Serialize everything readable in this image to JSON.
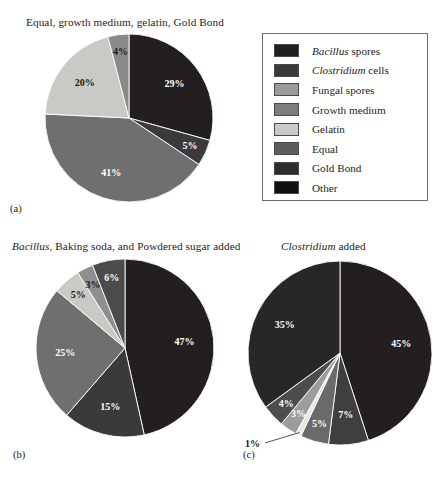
{
  "figure": {
    "caption_labels": {
      "a": "(a)",
      "b": "(b)",
      "c": "(c)"
    }
  },
  "legend": {
    "title": "",
    "items": [
      {
        "label": "Bacillus spores",
        "italic_prefix": "Bacillus",
        "rest": " spores",
        "color": "#231f20"
      },
      {
        "label": "Clostridium cells",
        "italic_prefix": "Clostridium",
        "rest": " cells",
        "color": "#3a3a3a"
      },
      {
        "label": "Fungal spores",
        "italic_prefix": "",
        "rest": "Fungal spores",
        "color": "#9a9a9a"
      },
      {
        "label": "Growth medium",
        "italic_prefix": "",
        "rest": "Growth medium",
        "color": "#7d7d7d"
      },
      {
        "label": "Gelatin",
        "italic_prefix": "",
        "rest": "Gelatin",
        "color": "#c9c9c5"
      },
      {
        "label": "Equal",
        "italic_prefix": "",
        "rest": "Equal",
        "color": "#5d5d5d"
      },
      {
        "label": "Gold Bond",
        "italic_prefix": "",
        "rest": "Gold Bond",
        "color": "#2e2e2e"
      },
      {
        "label": "Other",
        "italic_prefix": "",
        "rest": "Other",
        "color": "#111111"
      }
    ]
  },
  "chart_data": [
    {
      "type": "pie",
      "panel": "(a)",
      "title": "Equal, growth medium, gelatin, Gold Bond",
      "title_italic_prefix": "",
      "legend_position": "right",
      "categories": [
        "Bacillus spores",
        "Clostridium cells",
        "Growth medium",
        "Gelatin",
        "Fungal spores"
      ],
      "values": [
        29,
        5,
        41,
        20,
        4
      ],
      "labels": [
        "29%",
        "5%",
        "41%",
        "20%",
        "4%"
      ],
      "colors": [
        "#231f20",
        "#3a3a3a",
        "#6f6f6f",
        "#c9c9c5",
        "#8a8a8a"
      ],
      "label_colors": [
        "#ffffff",
        "#ffffff",
        "#ffffff",
        "#1a1a1a",
        "#1a1a1a"
      ],
      "start_angle_deg": 0
    },
    {
      "type": "pie",
      "panel": "(b)",
      "title": "Bacillus, Baking soda, and Powdered sugar added",
      "title_italic_prefix": "Bacillus",
      "title_rest": ", Baking soda, and Powdered sugar added",
      "legend_position": "shared",
      "categories": [
        "Bacillus spores",
        "Clostridium cells",
        "Growth medium",
        "Gelatin",
        "Fungal spores",
        "Equal"
      ],
      "values": [
        47,
        15,
        25,
        5,
        3,
        6
      ],
      "labels": [
        "47%",
        "15%",
        "25%",
        "5%",
        "3%",
        "6%"
      ],
      "colors": [
        "#231f20",
        "#3a3a3a",
        "#6f6f6f",
        "#c9c9c5",
        "#8f8f8f",
        "#4b4b4b"
      ],
      "label_colors": [
        "#ffffff",
        "#ffffff",
        "#ffffff",
        "#1a1a1a",
        "#1a1a1a",
        "#ffffff"
      ],
      "start_angle_deg": 0
    },
    {
      "type": "pie",
      "panel": "(c)",
      "title": "Clostridium added",
      "title_italic_prefix": "Clostridium",
      "title_rest": " added",
      "legend_position": "shared",
      "categories": [
        "Bacillus spores",
        "Clostridium cells",
        "Growth medium",
        "Gelatin",
        "Fungal spores",
        "Equal",
        "Other"
      ],
      "values": [
        45,
        7,
        5,
        1,
        3,
        4,
        35
      ],
      "labels": [
        "45%",
        "7%",
        "5%",
        "1%",
        "3%",
        "4%",
        "35%"
      ],
      "colors": [
        "#231f20",
        "#3f3f3f",
        "#6a6a6a",
        "#e8e8e6",
        "#9c9c9c",
        "#4d4d4d",
        "#272727"
      ],
      "label_colors": [
        "#ffffff",
        "#ffffff",
        "#ffffff",
        "#1a1a1a",
        "#ffffff",
        "#ffffff",
        "#ffffff"
      ],
      "start_angle_deg": 0,
      "callout": {
        "label": "1%",
        "for_slice": "Gelatin"
      }
    }
  ]
}
